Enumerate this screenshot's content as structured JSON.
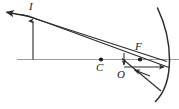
{
  "figure": {
    "type": "ray-diagram",
    "background_color": "#ffffff",
    "stroke_color": "#2b2b2b",
    "axis_color": "#8a8a8a",
    "label_color": "#1a1a1a",
    "width": 179,
    "height": 109
  },
  "labels": {
    "image_point": "I",
    "center_of_curvature": "C",
    "vertex": "O",
    "focal_point": "F"
  },
  "points": [
    {
      "name": "C",
      "label": "C",
      "x": 101,
      "y": 59.5,
      "marker": "filled-dot"
    },
    {
      "name": "F",
      "label": "F",
      "x": 140,
      "y": 59.5,
      "marker": "filled-dot"
    },
    {
      "name": "I",
      "label": "I",
      "x": 33,
      "y": 18,
      "marker": "none"
    },
    {
      "name": "O",
      "label": "O",
      "x": 124,
      "y": 59.5,
      "marker": "none"
    }
  ],
  "elements": {
    "principal_axis": {
      "x1": 17,
      "y1": 59.5,
      "x2": 179,
      "y2": 59.5
    },
    "object_arrow": {
      "x1": 33,
      "y1": 59.5,
      "x2": 33,
      "y2": 19,
      "arrow": "up"
    },
    "incident_ray": {
      "x1": 4,
      "y1": 12,
      "x2": 169,
      "y2": 67,
      "arrow": "left-end"
    },
    "reflected_ray": {
      "x1": 25,
      "y1": 15,
      "x2": 166,
      "y2": 61,
      "arrow": "none"
    },
    "lower_ray": {
      "x1": 124,
      "y1": 60,
      "x2": 160,
      "y2": 90,
      "arrow": "none"
    },
    "o_tick": {
      "x1": 124,
      "y1": 53,
      "x2": 124,
      "y2": 66,
      "arrow": "down"
    },
    "o_to_mirror_arrow": {
      "x1": 124,
      "y1": 67,
      "x2": 163,
      "y2": 67,
      "arrow": "right"
    },
    "mirror_arc": {
      "top_x": 157,
      "top_y": 8,
      "vertex_x": 168,
      "vertex_y": 59,
      "bottom_x": 155,
      "bottom_y": 101
    }
  }
}
